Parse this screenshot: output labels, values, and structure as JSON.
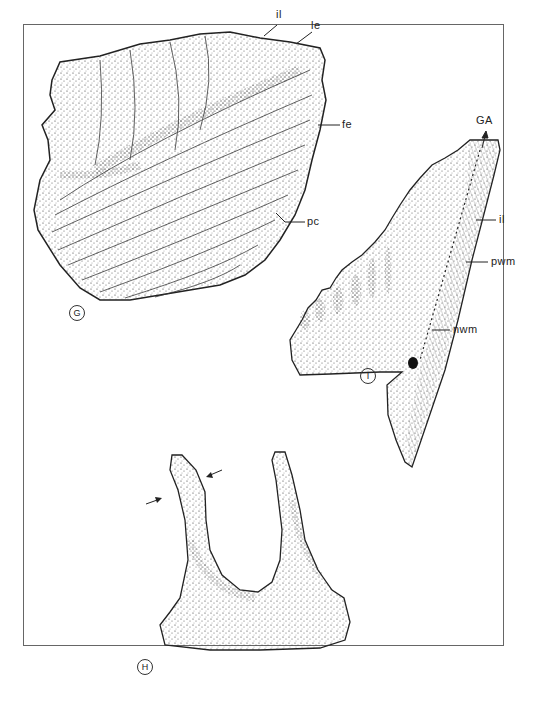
{
  "figure": {
    "panels": [
      {
        "id": "G",
        "label": "G",
        "description": "stippled drawing of platform conodont element with concentric growth lamellae"
      },
      {
        "id": "H",
        "label": "H",
        "description": "stippled drawing of U-shaped element with two denticles, arrows marking a zone"
      },
      {
        "id": "I",
        "label": "I",
        "description": "stippled drawing of blade-like element with denticles and wall structures"
      }
    ],
    "annotations": {
      "G": [
        "il",
        "le",
        "fe",
        "pc"
      ],
      "I": [
        "GA",
        "il",
        "pwm",
        "nwm"
      ]
    },
    "labels": {
      "g_il": "il",
      "g_le": "le",
      "g_fe": "fe",
      "g_pc": "pc",
      "i_ga": "GA",
      "i_il": "il",
      "i_pwm": "pwm",
      "i_nwm": "nwm",
      "panel_g": "G",
      "panel_h": "H",
      "panel_i": "I"
    },
    "colors": {
      "ink": "#222222",
      "frame": "#666666",
      "background": "#ffffff"
    }
  }
}
